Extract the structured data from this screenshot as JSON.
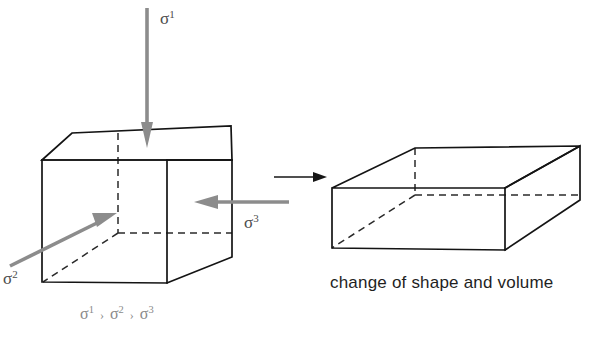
{
  "figure": {
    "background_color": "#ffffff",
    "edge_color": "#141414",
    "hidden_edge_color": "#2a2a2a",
    "stress_arrow_color": "#8c8c8c",
    "transition_arrow_color": "#161616"
  },
  "labels": {
    "sigma1": {
      "symbol": "σ",
      "superscript": "1"
    },
    "sigma2": {
      "symbol": "σ",
      "superscript": "2"
    },
    "sigma3": {
      "symbol": "σ",
      "superscript": "3"
    },
    "relation": {
      "first": "σ",
      "first_sup": "1",
      "op1": "›",
      "second": "σ",
      "second_sup": "2",
      "op2": "›",
      "third": "σ",
      "third_sup": "3"
    },
    "caption": "change of shape and volume"
  },
  "diagram_parts": {
    "left_shape": "cube (undeformed)",
    "right_shape": "flattened box (deformed)",
    "transition": "arrow from cube to flattened box"
  }
}
